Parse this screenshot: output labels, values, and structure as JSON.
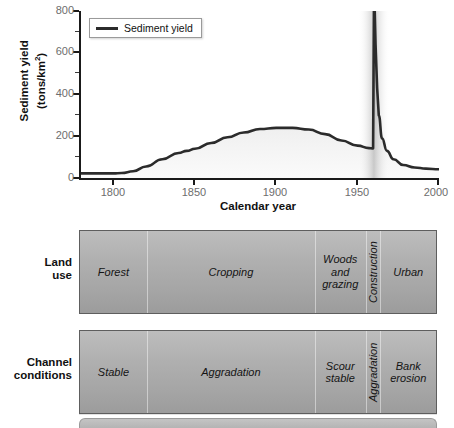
{
  "figure": {
    "y_axis_title_line1": "Sediment yield",
    "y_axis_title_line2_pre": "(tons/km",
    "y_axis_title_line2_sup": "2",
    "y_axis_title_line2_post": ")",
    "x_axis_title": "Calendar year",
    "legend_label": "Sediment yield",
    "legend_line_color": "#2b2b2b"
  },
  "chart_data": {
    "type": "line",
    "title": "",
    "xlabel": "Calendar year",
    "ylabel": "Sediment yield (tons/km2)",
    "xlim": [
      1780,
      2000
    ],
    "ylim": [
      0,
      800
    ],
    "xticks": [
      1800,
      1850,
      1900,
      1950,
      2000
    ],
    "yticks": [
      0,
      200,
      400,
      600,
      800
    ],
    "yticks_minor": [
      100,
      300,
      500,
      700
    ],
    "grid": false,
    "legend_position": "top-left",
    "series": [
      {
        "name": "Sediment yield",
        "color": "#2b2b2b",
        "x": [
          1780,
          1790,
          1800,
          1805,
          1812,
          1820,
          1830,
          1840,
          1845,
          1850,
          1860,
          1870,
          1880,
          1890,
          1900,
          1910,
          1920,
          1930,
          1940,
          1950,
          1957,
          1959,
          1959.5,
          1960,
          1960.5,
          1961,
          1962,
          1963,
          1965,
          1968,
          1972,
          1978,
          1985,
          1992,
          2000
        ],
        "y": [
          22,
          22,
          22,
          24,
          32,
          55,
          90,
          120,
          130,
          140,
          168,
          195,
          218,
          235,
          240,
          240,
          232,
          210,
          180,
          155,
          143,
          142,
          142,
          800,
          800,
          640,
          430,
          300,
          190,
          130,
          90,
          62,
          50,
          45,
          42
        ]
      }
    ],
    "shading_note": "gray gradient shading beneath the curve"
  },
  "bands": [
    {
      "label_line1": "Land",
      "label_line2": "use",
      "label_name": "land-use",
      "segments": [
        {
          "text": "Forest",
          "orientation": "horizontal",
          "start_pct": 0.0,
          "width_pct": 18.8
        },
        {
          "text": "Cropping",
          "orientation": "horizontal",
          "start_pct": 18.8,
          "width_pct": 47.2
        },
        {
          "text": "Woods and grazing",
          "orientation": "horizontal",
          "start_pct": 66.0,
          "width_pct": 14.2
        },
        {
          "text": "Construction",
          "orientation": "vertical",
          "start_pct": 80.2,
          "width_pct": 4.2
        },
        {
          "text": "Urban",
          "orientation": "horizontal",
          "start_pct": 84.4,
          "width_pct": 15.6
        }
      ]
    },
    {
      "label_line1": "Channel",
      "label_line2": "conditions",
      "label_name": "channel-conditions",
      "segments": [
        {
          "text": "Stable",
          "orientation": "horizontal",
          "start_pct": 0.0,
          "width_pct": 18.8
        },
        {
          "text": "Aggradation",
          "orientation": "horizontal",
          "start_pct": 18.8,
          "width_pct": 47.2
        },
        {
          "text": "Scour stable",
          "orientation": "horizontal",
          "start_pct": 66.0,
          "width_pct": 14.2
        },
        {
          "text": "Aggradation",
          "orientation": "vertical",
          "start_pct": 80.2,
          "width_pct": 4.2
        },
        {
          "text": "Bank erosion",
          "orientation": "horizontal",
          "start_pct": 84.4,
          "width_pct": 15.6
        }
      ]
    }
  ]
}
